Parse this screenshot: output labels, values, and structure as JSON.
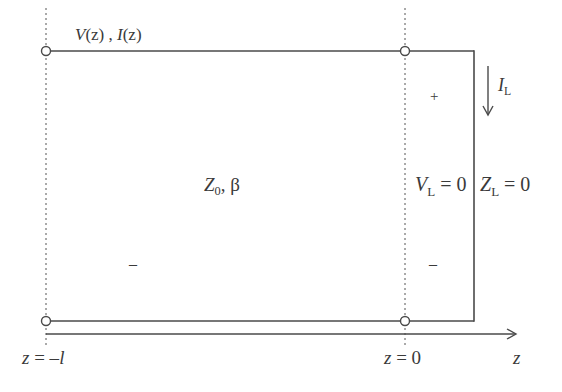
{
  "diagram": {
    "type": "transmission-line-short-circuit",
    "colors": {
      "line": "#4a4a4a",
      "text": "#3a3a3a",
      "background": "#ffffff"
    },
    "labels": {
      "voltage_current": {
        "v": "V",
        "v_arg": "(z)",
        "sep": " , ",
        "i": "I",
        "i_arg": "(z)"
      },
      "line_params": {
        "z": "Z",
        "z_sub": "0",
        "rest": ", β"
      },
      "plus": "+",
      "minus_left": "–",
      "minus_right": "–",
      "load_current": {
        "i": "I",
        "sub": "L"
      },
      "load_voltage": {
        "v": "V",
        "sub": "L",
        "rest": " = 0"
      },
      "load_impedance": {
        "z": "Z",
        "sub": "L",
        "rest": " = 0"
      },
      "left_position": {
        "z": "z",
        "eq": " = –",
        "l": "l"
      },
      "right_position": {
        "z": "z",
        "eq": " = 0"
      },
      "axis_label": "z"
    }
  }
}
